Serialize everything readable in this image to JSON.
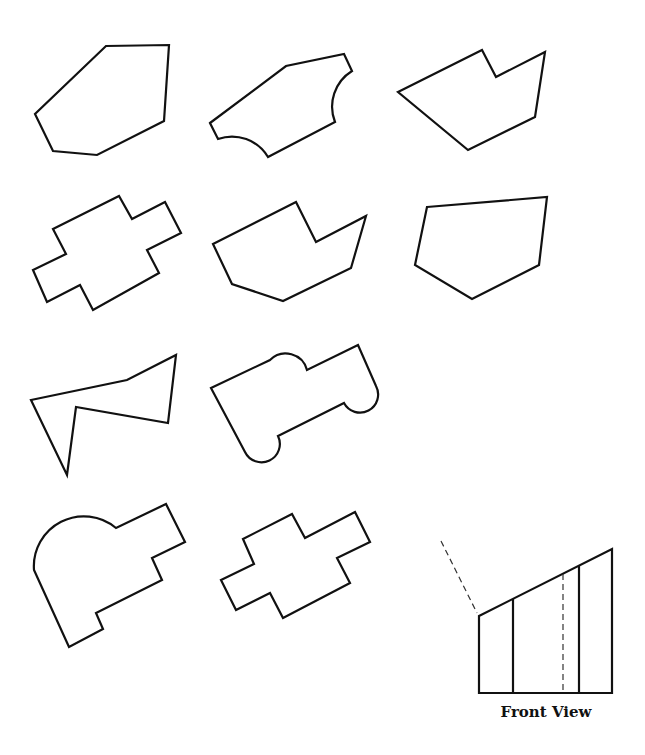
{
  "figure": {
    "type": "shape-identification-puzzle",
    "stroke_color": "#111111",
    "background": "#ffffff",
    "shapes": [
      {
        "id": 1,
        "name": "hexagon-outline"
      },
      {
        "id": 2,
        "name": "polygon-with-two-concave-arcs"
      },
      {
        "id": 3,
        "name": "notched-pentagon-right"
      },
      {
        "id": 4,
        "name": "cross-shape-left"
      },
      {
        "id": 5,
        "name": "notched-heptagon"
      },
      {
        "id": 6,
        "name": "pentagon-outline"
      },
      {
        "id": 7,
        "name": "zigzag-polygon"
      },
      {
        "id": 8,
        "name": "rounded-notched-shape"
      },
      {
        "id": 9,
        "name": "rounded-top-stepped-shape"
      },
      {
        "id": 10,
        "name": "cross-shape-middle"
      }
    ],
    "front_view": {
      "label": "Front View",
      "hidden_edges": 2,
      "visible_vertical_divisions": 2
    }
  }
}
